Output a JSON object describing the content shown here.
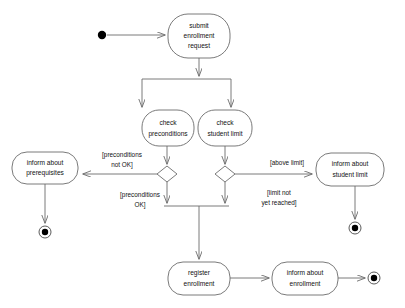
{
  "diagram": {
    "type": "uml-activity-diagram",
    "canvas": {
      "width": 405,
      "height": 308,
      "background": "#ffffff"
    },
    "colors": {
      "stroke": "#6b6b6b",
      "text": "#111111",
      "node_fill": "#ffffff",
      "bar": "#1a1a1a",
      "initial_node": "#000000",
      "final_node": "#000000"
    },
    "nodes": {
      "initial": {
        "kind": "initial-node",
        "cx": 102,
        "cy": 35,
        "r": 4.2
      },
      "submit": {
        "kind": "action",
        "label_lines": [
          "submit",
          "enrollment",
          "request"
        ],
        "x": 168,
        "y": 14,
        "w": 62,
        "h": 44
      },
      "fork_bar": {
        "kind": "fork-bar",
        "x1": 142,
        "y1": 79,
        "x2": 231,
        "y2": 79
      },
      "check_preconditions": {
        "kind": "action",
        "label_lines": [
          "check",
          "preconditions"
        ],
        "x": 142,
        "y": 110,
        "w": 52,
        "h": 36
      },
      "check_student_limit": {
        "kind": "action",
        "label_lines": [
          "check",
          "student limit"
        ],
        "x": 198,
        "y": 110,
        "w": 54,
        "h": 36
      },
      "decision_preconditions": {
        "kind": "decision",
        "cx": 167,
        "cy": 174,
        "rx": 10,
        "ry": 8
      },
      "decision_student_limit": {
        "kind": "decision",
        "cx": 225,
        "cy": 174,
        "rx": 10,
        "ry": 8
      },
      "join_bar": {
        "kind": "join-bar",
        "x1": 164,
        "y1": 206,
        "x2": 229,
        "y2": 206
      },
      "inform_prerequisites": {
        "kind": "action",
        "label_lines": [
          "inform about",
          "prerequisites"
        ],
        "x": 12,
        "y": 152,
        "w": 66,
        "h": 32
      },
      "inform_student_limit": {
        "kind": "action",
        "label_lines": [
          "inform about",
          "student limit"
        ],
        "x": 316,
        "y": 153,
        "w": 68,
        "h": 33
      },
      "register_enrollment": {
        "kind": "action",
        "label_lines": [
          "register",
          "enrollment"
        ],
        "x": 168,
        "y": 262,
        "w": 62,
        "h": 33
      },
      "inform_enrollment": {
        "kind": "action",
        "label_lines": [
          "inform about",
          "enrollment"
        ],
        "x": 272,
        "y": 262,
        "w": 66,
        "h": 33
      },
      "final_prerequisites": {
        "kind": "final-node",
        "cx": 45,
        "cy": 232,
        "r_outer": 6,
        "r_inner": 3.2
      },
      "final_student_limit": {
        "kind": "final-node",
        "cx": 355,
        "cy": 228,
        "r_outer": 6,
        "r_inner": 3.2
      },
      "final_enrollment": {
        "kind": "final-node",
        "cx": 374,
        "cy": 278,
        "r_outer": 6,
        "r_inner": 3.2
      }
    },
    "guards": [
      {
        "id": "preconditions-not-ok",
        "lines": [
          "[preconditions",
          "not OK]"
        ],
        "x": 122,
        "y": 155
      },
      {
        "id": "preconditions-ok",
        "lines": [
          "[preconditions",
          "OK]"
        ],
        "x": 140,
        "y": 195
      },
      {
        "id": "above-limit",
        "lines": [
          "[above limit]"
        ],
        "x": 287,
        "y": 163
      },
      {
        "id": "limit-not-yet-reached",
        "lines": [
          "[limit not",
          "yet reached]"
        ],
        "x": 279,
        "y": 193
      }
    ],
    "edges": [
      {
        "id": "initial-to-submit",
        "from": "initial",
        "to": "submit"
      },
      {
        "id": "submit-to-fork",
        "from": "submit",
        "to": "fork_bar"
      },
      {
        "id": "fork-to-check-preconditions",
        "from": "fork_bar",
        "to": "check_preconditions"
      },
      {
        "id": "fork-to-check-student-limit",
        "from": "fork_bar",
        "to": "check_student_limit"
      },
      {
        "id": "check-preconditions-to-decision",
        "from": "check_preconditions",
        "to": "decision_preconditions"
      },
      {
        "id": "check-student-limit-to-decision",
        "from": "check_student_limit",
        "to": "decision_student_limit"
      },
      {
        "id": "decision-to-inform-prerequisites",
        "from": "decision_preconditions",
        "to": "inform_prerequisites",
        "guard": "preconditions-not-ok"
      },
      {
        "id": "decision-to-join-left",
        "from": "decision_preconditions",
        "to": "join_bar",
        "guard": "preconditions-ok"
      },
      {
        "id": "decision-to-inform-student-limit",
        "from": "decision_student_limit",
        "to": "inform_student_limit",
        "guard": "above-limit"
      },
      {
        "id": "decision-to-join-right",
        "from": "decision_student_limit",
        "to": "join_bar",
        "guard": "limit-not-yet-reached"
      },
      {
        "id": "join-to-register",
        "from": "join_bar",
        "to": "register_enrollment"
      },
      {
        "id": "register-to-inform",
        "from": "register_enrollment",
        "to": "inform_enrollment"
      },
      {
        "id": "inform-enrollment-to-final",
        "from": "inform_enrollment",
        "to": "final_enrollment"
      },
      {
        "id": "inform-prerequisites-to-final",
        "from": "inform_prerequisites",
        "to": "final_prerequisites"
      },
      {
        "id": "inform-student-limit-to-final",
        "from": "inform_student_limit",
        "to": "final_student_limit"
      }
    ]
  }
}
